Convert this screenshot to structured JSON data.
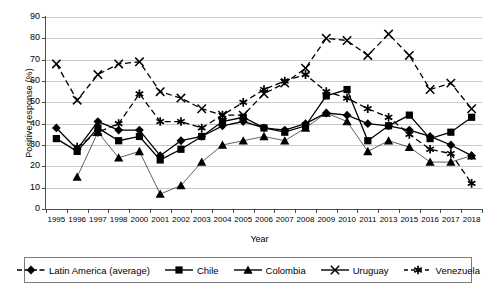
{
  "chart_data": {
    "type": "line",
    "title": "",
    "xlabel": "Year",
    "ylabel": "Positive response (%)",
    "ylim": [
      0,
      90
    ],
    "yticks": [
      0,
      10,
      20,
      30,
      40,
      50,
      60,
      70,
      80,
      90
    ],
    "grid": true,
    "legend_position": "bottom",
    "categories": [
      "1995",
      "1996",
      "1997",
      "1998",
      "2000",
      "2001",
      "2002",
      "2003",
      "2004",
      "2005",
      "2006",
      "2007",
      "2008",
      "2009",
      "2010",
      "2011",
      "2013",
      "2015",
      "2016",
      "2017",
      "2018"
    ],
    "series": [
      {
        "name": "Latin America (average)",
        "marker": "diamond",
        "linestyle": "solid",
        "values": [
          38,
          28,
          41,
          37,
          37,
          25,
          32,
          34,
          39,
          41,
          38,
          37,
          40,
          45,
          44,
          40,
          39,
          37,
          34,
          30,
          25
        ]
      },
      {
        "name": "Chile",
        "marker": "square",
        "linestyle": "solid",
        "values": [
          33,
          27,
          38,
          32,
          34,
          23,
          28,
          34,
          41,
          43,
          38,
          36,
          39,
          53,
          56,
          32,
          39,
          44,
          33,
          36,
          43
        ]
      },
      {
        "name": "Colombia",
        "marker": "triangle",
        "linestyle": "solid",
        "values": [
          null,
          15,
          36,
          24,
          27,
          7,
          11,
          22,
          30,
          32,
          34,
          32,
          38,
          45,
          41,
          27,
          32,
          29,
          22,
          22,
          25
        ]
      },
      {
        "name": "Uruguay",
        "marker": "cross",
        "linestyle": "dashed",
        "values": [
          68,
          51,
          63,
          68,
          69,
          55,
          52,
          47,
          44,
          44,
          54,
          59,
          66,
          80,
          79,
          72,
          82,
          72,
          56,
          59,
          47
        ]
      },
      {
        "name": "Venezuela",
        "marker": "asterisk",
        "linestyle": "dashed",
        "values": [
          null,
          29,
          36,
          40,
          54,
          41,
          41,
          38,
          44,
          50,
          56,
          60,
          63,
          55,
          52,
          47,
          43,
          35,
          28,
          26,
          12
        ]
      }
    ]
  },
  "legend": {
    "items": [
      {
        "label": "Latin America (average)",
        "marker": "diamond-marker-icon"
      },
      {
        "label": "Chile",
        "marker": "square-marker-icon"
      },
      {
        "label": "Colombia",
        "marker": "triangle-marker-icon"
      },
      {
        "label": "Uruguay",
        "marker": "cross-marker-icon"
      },
      {
        "label": "Venezuela",
        "marker": "asterisk-marker-icon"
      }
    ]
  },
  "colors": {
    "line": "#000000",
    "grid": "#c9c9c9",
    "axis": "#4d4d4d",
    "background": "#ffffff"
  }
}
